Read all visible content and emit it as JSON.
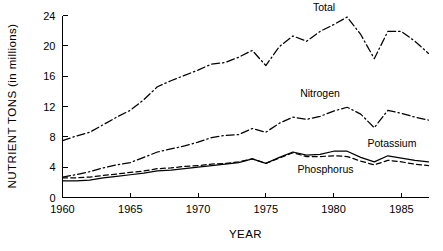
{
  "chart_data": {
    "type": "line",
    "title": "",
    "xlabel": "YEAR",
    "ylabel": "NUTRIENT TONS (in millions)",
    "xlim": [
      1960,
      1987
    ],
    "ylim": [
      0,
      24
    ],
    "xticks": [
      1960,
      1965,
      1970,
      1975,
      1980,
      1985
    ],
    "yticks": [
      0,
      4,
      8,
      12,
      16,
      20,
      24
    ],
    "grid": false,
    "legend_position": "inline-annotations",
    "line_color": "#000000",
    "x": [
      1960,
      1961,
      1962,
      1963,
      1964,
      1965,
      1966,
      1967,
      1968,
      1969,
      1970,
      1971,
      1972,
      1973,
      1974,
      1975,
      1976,
      1977,
      1978,
      1979,
      1980,
      1981,
      1982,
      1983,
      1984,
      1985,
      1986,
      1987
    ],
    "series": [
      {
        "name": "Total",
        "label": "Total",
        "style": "dashdot",
        "values": [
          7.5,
          8.1,
          8.6,
          9.6,
          10.6,
          11.5,
          12.9,
          14.6,
          15.4,
          16.1,
          16.8,
          17.6,
          17.8,
          18.5,
          19.4,
          17.4,
          19.9,
          21.3,
          20.6,
          21.9,
          22.8,
          23.8,
          21.5,
          18.3,
          21.9,
          21.9,
          20.6,
          19.0
        ]
      },
      {
        "name": "Nitrogen",
        "label": "Nitrogen",
        "style": "dashdot",
        "values": [
          2.7,
          3.0,
          3.4,
          3.9,
          4.3,
          4.6,
          5.3,
          6.0,
          6.4,
          6.8,
          7.3,
          7.9,
          8.2,
          8.3,
          9.1,
          8.6,
          9.8,
          10.6,
          10.3,
          10.7,
          11.4,
          11.9,
          11.0,
          9.2,
          11.5,
          11.1,
          10.6,
          10.2
        ]
      },
      {
        "name": "Potassium",
        "label": "Potassium",
        "style": "solid",
        "values": [
          2.2,
          2.2,
          2.3,
          2.6,
          2.8,
          3.0,
          3.2,
          3.5,
          3.6,
          3.8,
          4.0,
          4.2,
          4.4,
          4.6,
          5.1,
          4.5,
          5.3,
          6.0,
          5.6,
          5.7,
          6.1,
          6.1,
          5.3,
          4.7,
          5.5,
          5.2,
          4.9,
          4.7
        ]
      },
      {
        "name": "Phosphorus",
        "label": "Phosphorus",
        "style": "dashed",
        "values": [
          2.6,
          2.6,
          2.7,
          2.9,
          3.1,
          3.3,
          3.5,
          3.8,
          3.9,
          4.1,
          4.2,
          4.4,
          4.5,
          4.7,
          5.1,
          4.5,
          5.2,
          5.9,
          5.4,
          5.4,
          5.5,
          5.4,
          4.8,
          4.3,
          4.9,
          4.7,
          4.4,
          4.2
        ]
      }
    ],
    "annotations": [
      {
        "text": "Total",
        "x": 1979.3,
        "y": 24.6
      },
      {
        "text": "Nitrogen",
        "x": 1979.0,
        "y": 13.2
      },
      {
        "text": "Potassium",
        "x": 1984.3,
        "y": 6.6
      },
      {
        "text": "Phosphorus",
        "x": 1979.4,
        "y": 3.2
      }
    ]
  }
}
